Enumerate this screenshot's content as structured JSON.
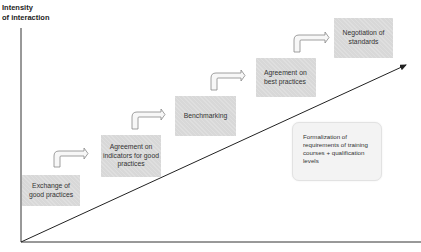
{
  "diagram": {
    "y_axis_title_line1": "Intensity",
    "y_axis_title_line2": "of interaction",
    "steps": [
      {
        "label": "Exchange of good practices"
      },
      {
        "label": "Agreement on indicators for good practices"
      },
      {
        "label": "Benchmarking"
      },
      {
        "label": "Agreement on best practices"
      },
      {
        "label": "Negotiation of standards"
      }
    ],
    "note": {
      "label": "Formalization of requirements of training courses + qualification levels"
    },
    "colors": {
      "box_fill": "#d8d8d8",
      "note_fill": "#f3f3f3",
      "line": "#222222",
      "arrow_outline": "#777777"
    }
  }
}
